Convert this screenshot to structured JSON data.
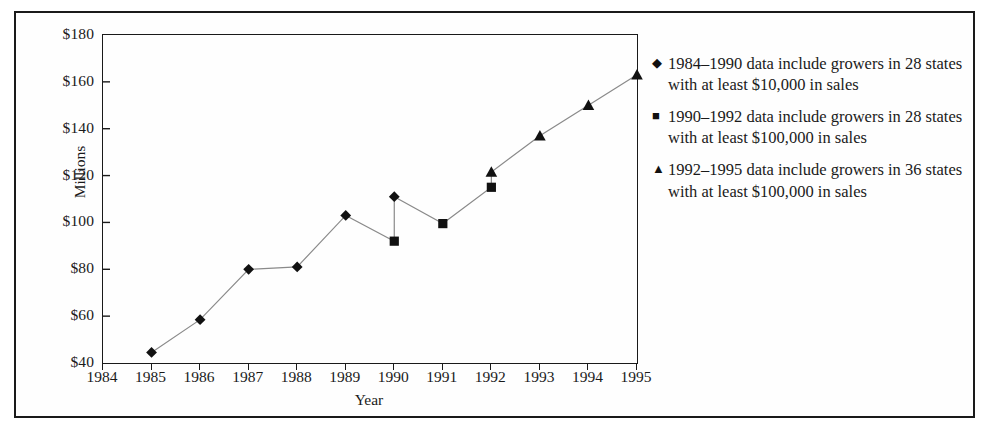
{
  "chart_data": {
    "type": "line",
    "title": "",
    "xlabel": "Year",
    "ylabel": "Millions",
    "xlim": [
      1984,
      1995
    ],
    "ylim": [
      40,
      180
    ],
    "yticks": [
      "$40",
      "$60",
      "$80",
      "$100",
      "$120",
      "$140",
      "$160",
      "$180"
    ],
    "ytick_values": [
      40,
      60,
      80,
      100,
      120,
      140,
      160,
      180
    ],
    "xticks": [
      "1984",
      "1985",
      "1986",
      "1987",
      "1988",
      "1989",
      "1990",
      "1991",
      "1992",
      "1993",
      "1994",
      "1995"
    ],
    "xtick_values": [
      1984,
      1985,
      1986,
      1987,
      1988,
      1989,
      1990,
      1991,
      1992,
      1993,
      1994,
      1995
    ],
    "grid": false,
    "legend_position": "right",
    "series": [
      {
        "name": "1984–1990 data include growers in 28 states with at least $10,000 in sales",
        "marker": "diamond",
        "x": [
          1985,
          1986,
          1987,
          1988,
          1989,
          1990
        ],
        "values": [
          44.5,
          58.5,
          80,
          81,
          103,
          111
        ]
      },
      {
        "name": "1990–1992 data include growers in 28 states with at least $100,000 in sales",
        "marker": "square",
        "x": [
          1990,
          1991,
          1992
        ],
        "values": [
          92,
          99.5,
          115
        ]
      },
      {
        "name": "1992–1995 data include growers in 36 states with at least $100,000 in sales",
        "marker": "triangle",
        "x": [
          1992,
          1993,
          1994,
          1995
        ],
        "values": [
          121.5,
          137,
          150,
          163
        ]
      }
    ]
  },
  "legend": {
    "entries": [
      {
        "marker_glyph": "◆",
        "marker_name": "diamond-marker",
        "text": "1984–1990 data include growers in 28 states with at least $10,000 in sales"
      },
      {
        "marker_glyph": "■",
        "marker_name": "square-marker",
        "text": "1990–1992 data include growers in 28 states with at least $100,000 in sales"
      },
      {
        "marker_glyph": "▲",
        "marker_name": "triangle-marker",
        "text": "1992–1995 data include growers in 36 states with at least $100,000 in sales"
      }
    ]
  },
  "colors": {
    "line": "#8a8a8a",
    "marker": "#111111",
    "axis": "#1a1a1a",
    "background": "#fefefe",
    "text": "#1a1a1a"
  }
}
